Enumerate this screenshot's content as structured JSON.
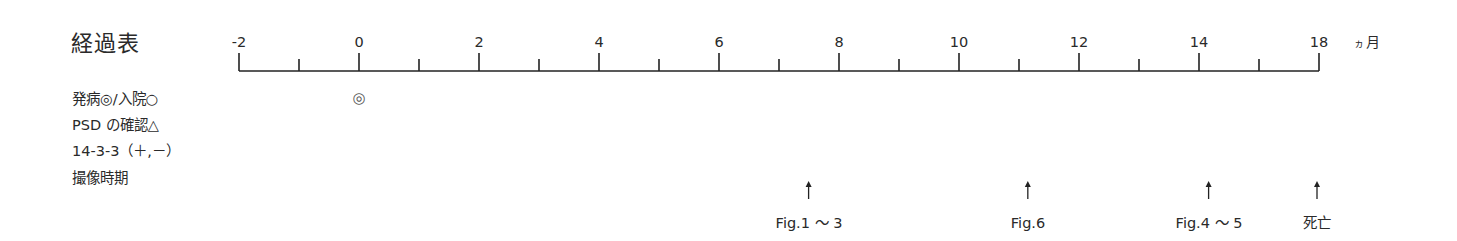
{
  "title": "経過表",
  "unit": {
    "small": "ヵ",
    "main": "月"
  },
  "row_labels": [
    "発病◎/入院○",
    "PSD の確認△",
    "14-3-3（＋,－）",
    "撮像時期"
  ],
  "axis": {
    "start_x": 239,
    "end_x": 1319,
    "baseline_y": 71,
    "px_per_month": 60,
    "major_ticks": [
      {
        "label": "-2",
        "x": 239
      },
      {
        "label": "0",
        "x": 359
      },
      {
        "label": "2",
        "x": 479
      },
      {
        "label": "4",
        "x": 599
      },
      {
        "label": "6",
        "x": 719
      },
      {
        "label": "8",
        "x": 839
      },
      {
        "label": "10",
        "x": 959
      },
      {
        "label": "12",
        "x": 1079
      },
      {
        "label": "14",
        "x": 1199
      },
      {
        "label": "18",
        "x": 1319
      }
    ],
    "minor_ticks_x": [
      299,
      419,
      539,
      659,
      779,
      899,
      1019,
      1139,
      1259
    ]
  },
  "markers": [
    {
      "symbol": "◎",
      "meaning": "発病",
      "month": 0,
      "x": 359,
      "y": 98
    }
  ],
  "events": [
    {
      "label": "Fig.1 〜 3",
      "x": 809
    },
    {
      "label": "Fig.6",
      "x": 1028
    },
    {
      "label": "Fig.4 〜 5",
      "x": 1209
    },
    {
      "label": "死亡",
      "x": 1317
    }
  ],
  "chart_data": {
    "type": "timeline",
    "title": "経過表",
    "xlabel": "ヵ月",
    "x_tick_labels": [
      "-2",
      "0",
      "2",
      "4",
      "6",
      "8",
      "10",
      "12",
      "14",
      "18"
    ],
    "rows": [
      "発病◎/入院○",
      "PSD の確認△",
      "14-3-3（＋,－）",
      "撮像時期"
    ],
    "onset": {
      "symbol": "◎",
      "month": 0
    },
    "imaging_events": [
      {
        "label": "Fig.1 〜 3",
        "month_approx": 7.5
      },
      {
        "label": "Fig.6",
        "month_approx": 11.2
      },
      {
        "label": "Fig.4 〜 5",
        "month_approx": 14.2
      }
    ],
    "death": {
      "label": "死亡",
      "month": 18
    }
  }
}
